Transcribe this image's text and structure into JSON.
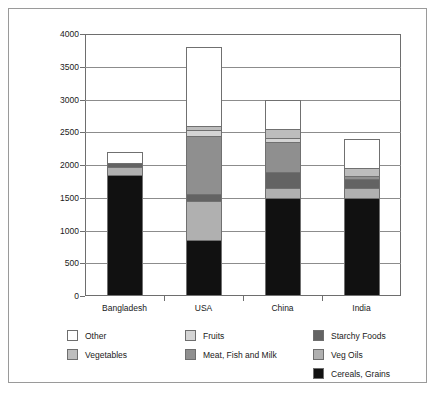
{
  "chart_data": {
    "type": "bar",
    "subtype": "stacked",
    "title": "",
    "xlabel": "",
    "ylabel": "",
    "categories": [
      "Bangladesh",
      "USA",
      "China",
      "India"
    ],
    "ylim": [
      0,
      4000
    ],
    "yticks": [
      0,
      500,
      1000,
      1500,
      2000,
      2500,
      3000,
      3500,
      4000
    ],
    "ytick_labels": [
      "0",
      "500",
      "1000",
      "1500",
      "2000",
      "2500",
      "3000",
      "3500",
      "4000"
    ],
    "grid": true,
    "legend_position": "bottom",
    "stack_order_bottom_to_top": [
      "Cereals, Grains",
      "Veg Oils",
      "Starchy Foods",
      "Meat, Fish and Milk",
      "Fruits",
      "Vegetables",
      "Other"
    ],
    "series": [
      {
        "name": "Cereals, Grains",
        "color": "#111111",
        "values": [
          1850,
          850,
          1500,
          1500
        ]
      },
      {
        "name": "Veg Oils",
        "color": "#b0b0b0",
        "values": [
          120,
          600,
          150,
          150
        ]
      },
      {
        "name": "Starchy Foods",
        "color": "#636363",
        "values": [
          60,
          100,
          250,
          130
        ]
      },
      {
        "name": "Meat, Fish and Milk",
        "color": "#8f8f8f",
        "values": [
          0,
          900,
          450,
          50
        ]
      },
      {
        "name": "Fruits",
        "color": "#d4d4d4",
        "values": [
          0,
          80,
          60,
          0
        ]
      },
      {
        "name": "Vegetables",
        "color": "#bdbdbd",
        "values": [
          0,
          70,
          140,
          120
        ]
      },
      {
        "name": "Other",
        "color": "#ffffff",
        "values": [
          170,
          1200,
          450,
          450
        ]
      }
    ],
    "totals": [
      2200,
      3800,
      3000,
      2500
    ]
  },
  "legend": {
    "columns": [
      [
        {
          "label": "Other",
          "color": "#ffffff"
        },
        {
          "label": "Vegetables",
          "color": "#bdbdbd"
        }
      ],
      [
        {
          "label": "Fruits",
          "color": "#d4d4d4"
        },
        {
          "label": "Meat, Fish and Milk",
          "color": "#8f8f8f"
        }
      ],
      [
        {
          "label": "Starchy Foods",
          "color": "#636363"
        },
        {
          "label": "Veg Oils",
          "color": "#b0b0b0"
        },
        {
          "label": "Cereals, Grains",
          "color": "#111111"
        }
      ]
    ]
  }
}
